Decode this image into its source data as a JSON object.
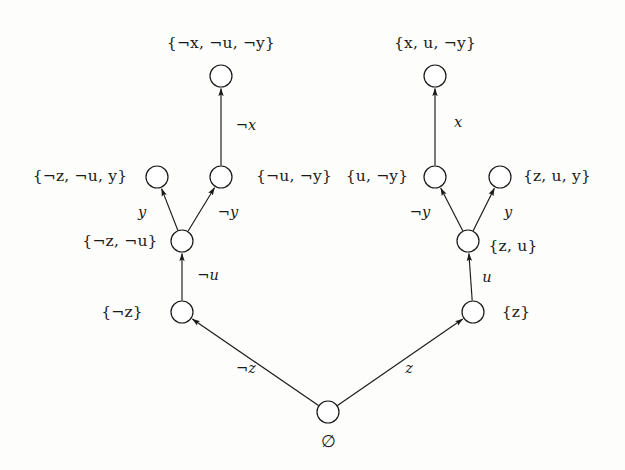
{
  "diagram": {
    "type": "decision-tree",
    "title": "",
    "background_color": "#fdfdfc",
    "stroke_color": "#1a1a1a",
    "node_radius": 11,
    "nodes": [
      {
        "id": "root",
        "x": 328,
        "y": 412,
        "label": "∅",
        "label_x": 328,
        "label_y": 441,
        "label_pos": "below"
      },
      {
        "id": "notz",
        "x": 182,
        "y": 312,
        "label": "{¬z}",
        "label_x": 122,
        "label_y": 313,
        "label_pos": "left"
      },
      {
        "id": "z",
        "x": 473,
        "y": 312,
        "label": "{z}",
        "label_x": 516,
        "label_y": 313,
        "label_pos": "right"
      },
      {
        "id": "notz_notu",
        "x": 182,
        "y": 241,
        "label": "{¬z, ¬u}",
        "label_x": 120,
        "label_y": 242,
        "label_pos": "left"
      },
      {
        "id": "z_u",
        "x": 468,
        "y": 241,
        "label": "{z, u}",
        "label_x": 513,
        "label_y": 247,
        "label_pos": "right"
      },
      {
        "id": "notz_notu_y",
        "x": 157,
        "y": 177,
        "label": "{¬z, ¬u, y}",
        "label_x": 80,
        "label_y": 177,
        "label_pos": "left"
      },
      {
        "id": "notu_noty",
        "x": 221,
        "y": 177,
        "label": "{¬u, ¬y}",
        "label_x": 294,
        "label_y": 177,
        "label_pos": "right"
      },
      {
        "id": "u_noty",
        "x": 435,
        "y": 177,
        "label": "{u, ¬y}",
        "label_x": 377,
        "label_y": 177,
        "label_pos": "left"
      },
      {
        "id": "z_u_y",
        "x": 500,
        "y": 177,
        "label": "{z, u, y}",
        "label_x": 557,
        "label_y": 177,
        "label_pos": "right"
      },
      {
        "id": "notx_notu_noty",
        "x": 221,
        "y": 76,
        "label": "{¬x, ¬u, ¬y}",
        "label_x": 221,
        "label_y": 44,
        "label_pos": "above"
      },
      {
        "id": "x_u_noty",
        "x": 435,
        "y": 76,
        "label": "{x, u, ¬y}",
        "label_x": 435,
        "label_y": 44,
        "label_pos": "above"
      }
    ],
    "edges": [
      {
        "from": "root",
        "to": "notz",
        "label": "¬z",
        "label_x": 246,
        "label_y": 368
      },
      {
        "from": "root",
        "to": "z",
        "label": "z",
        "label_x": 409,
        "label_y": 368
      },
      {
        "from": "notz",
        "to": "notz_notu",
        "label": "¬u",
        "label_x": 208,
        "label_y": 275
      },
      {
        "from": "z",
        "to": "z_u",
        "label": "u",
        "label_x": 487,
        "label_y": 277
      },
      {
        "from": "notz_notu",
        "to": "notz_notu_y",
        "label": "y",
        "label_x": 142,
        "label_y": 212
      },
      {
        "from": "notz_notu",
        "to": "notu_noty",
        "label": "¬y",
        "label_x": 228,
        "label_y": 212
      },
      {
        "from": "z_u",
        "to": "u_noty",
        "label": "¬y",
        "label_x": 420,
        "label_y": 212
      },
      {
        "from": "z_u",
        "to": "z_u_y",
        "label": "y",
        "label_x": 508,
        "label_y": 212
      },
      {
        "from": "notu_noty",
        "to": "notx_notu_noty",
        "label": "¬x",
        "label_x": 246,
        "label_y": 125
      },
      {
        "from": "u_noty",
        "to": "x_u_noty",
        "label": "x",
        "label_x": 458,
        "label_y": 122
      }
    ]
  }
}
